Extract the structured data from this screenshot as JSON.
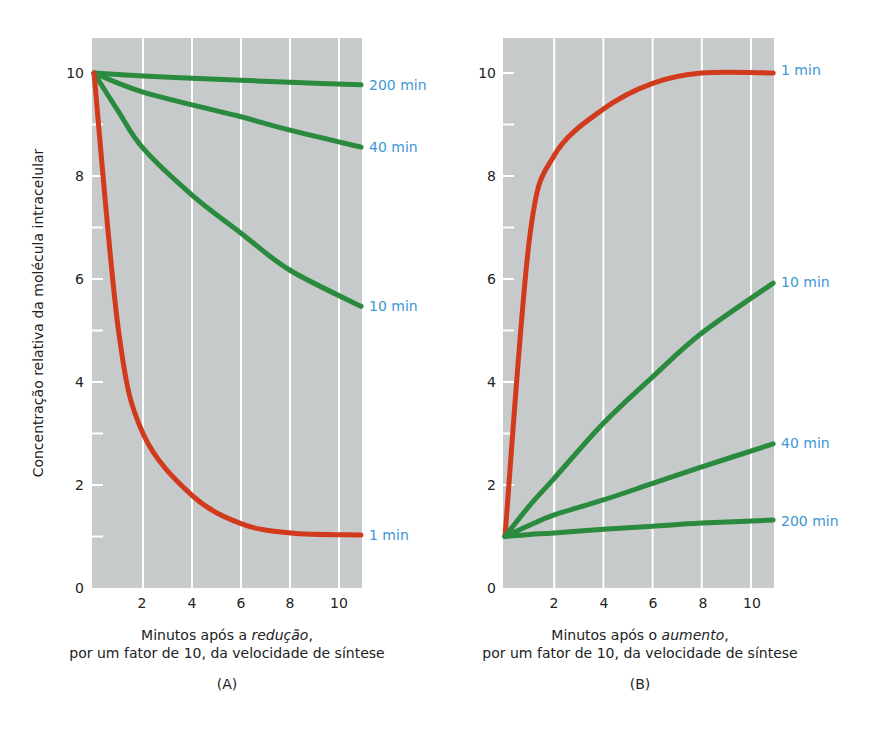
{
  "colors": {
    "plot_background": "#c6caca",
    "gridline": "#ffffff",
    "decay_fast": "#d23a1e",
    "slow_series": "#2a8a3e",
    "series_label": "#3d97d3"
  },
  "chart_data": [
    {
      "type": "line",
      "panel": "(A)",
      "title": "",
      "ylabel": "Concentração relativa da molécula intracelular",
      "xlabel_line1_prefix": "Minutos após a ",
      "xlabel_line1_emph": "redução",
      "xlabel_line1_suffix": ",",
      "xlabel_line2": "por um fator de 10, da velocidade de síntese",
      "xlim": [
        0,
        10.9
      ],
      "ylim": [
        0,
        10.9
      ],
      "xticks": [
        2,
        4,
        6,
        8,
        10
      ],
      "yticks": [
        0,
        2,
        4,
        6,
        8,
        10
      ],
      "grid": "vertical lines at each x tick",
      "legend": "inline labels at right end of each line",
      "x": [
        0,
        1,
        2,
        4,
        6,
        8,
        10.9
      ],
      "series": [
        {
          "name": "200 min",
          "color": "#2a8a3e",
          "values": [
            10,
            9.97,
            9.94,
            9.9,
            9.86,
            9.82,
            9.77
          ]
        },
        {
          "name": "40 min",
          "color": "#2a8a3e",
          "values": [
            10,
            9.8,
            9.63,
            9.38,
            9.15,
            8.89,
            8.56
          ]
        },
        {
          "name": "10 min",
          "color": "#2a8a3e",
          "values": [
            10,
            9.25,
            8.54,
            7.63,
            6.89,
            6.17,
            5.47
          ]
        },
        {
          "name": "1 min",
          "color": "#d23a1e",
          "values": [
            10,
            5.0,
            3.0,
            1.8,
            1.25,
            1.07,
            1.03
          ]
        }
      ]
    },
    {
      "type": "line",
      "panel": "(B)",
      "title": "",
      "ylabel": "",
      "xlabel_line1_prefix": "Minutos após o ",
      "xlabel_line1_emph": "aumento",
      "xlabel_line1_suffix": ",",
      "xlabel_line2": "por um fator de 10, da velocidade de síntese",
      "xlim": [
        0,
        10.9
      ],
      "ylim": [
        0,
        10.9
      ],
      "xticks": [
        2,
        4,
        6,
        8,
        10
      ],
      "yticks": [
        0,
        2,
        4,
        6,
        8,
        10
      ],
      "grid": "vertical lines at each x tick",
      "legend": "inline labels at right end of each line",
      "x": [
        0,
        1,
        2,
        4,
        6,
        8,
        10.9
      ],
      "series": [
        {
          "name": "1 min",
          "color": "#d23a1e",
          "values": [
            1,
            6.8,
            8.4,
            9.3,
            9.8,
            10.0,
            10.0
          ]
        },
        {
          "name": "10 min",
          "color": "#2a8a3e",
          "values": [
            1,
            1.6,
            2.13,
            3.2,
            4.1,
            4.95,
            5.92
          ]
        },
        {
          "name": "40 min",
          "color": "#2a8a3e",
          "values": [
            1,
            1.22,
            1.42,
            1.71,
            2.03,
            2.35,
            2.8
          ]
        },
        {
          "name": "200 min",
          "color": "#2a8a3e",
          "values": [
            1,
            1.04,
            1.07,
            1.14,
            1.2,
            1.26,
            1.32
          ]
        }
      ]
    }
  ],
  "panels": {
    "a": {
      "tick_labels_y": [
        "0",
        "2",
        "4",
        "6",
        "8",
        "10"
      ],
      "tick_labels_x": [
        "2",
        "4",
        "6",
        "8",
        "10"
      ],
      "series_labels": [
        "200 min",
        "40 min",
        "10 min",
        "1 min"
      ],
      "ylabel": "Concentração relativa da molécula intracelular",
      "xlabel_line1_prefix": "Minutos após a ",
      "xlabel_line1_emph": "redução",
      "xlabel_line1_suffix": ",",
      "xlabel_line2": "por um fator de 10, da velocidade de síntese",
      "panel_label": "(A)"
    },
    "b": {
      "tick_labels_y": [
        "0",
        "2",
        "4",
        "6",
        "8",
        "10"
      ],
      "tick_labels_x": [
        "2",
        "4",
        "6",
        "8",
        "10"
      ],
      "series_labels": [
        "1 min",
        "10 min",
        "40 min",
        "200 min"
      ],
      "xlabel_line1_prefix": "Minutos após o ",
      "xlabel_line1_emph": "aumento",
      "xlabel_line1_suffix": ",",
      "xlabel_line2": "por um fator de 10, da velocidade de síntese",
      "panel_label": "(B)"
    }
  }
}
